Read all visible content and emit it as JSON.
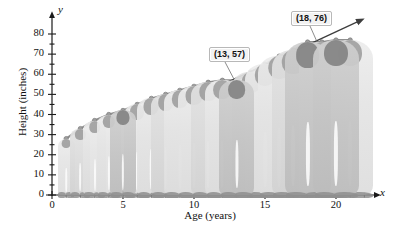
{
  "chart_data": {
    "type": "line",
    "title": "",
    "xlabel": "Age (years)",
    "ylabel": "Height (inches)",
    "x_axis_name": "x",
    "y_axis_name": "y",
    "xlim": [
      0,
      22
    ],
    "ylim": [
      0,
      85
    ],
    "grid": false,
    "legend": "none",
    "x_ticks_labeled": [
      "0",
      "5",
      "10",
      "15",
      "20"
    ],
    "x_ticks_labeled_values": [
      0,
      5,
      10,
      15,
      20
    ],
    "x_tick_step_minor": 1,
    "y_ticks_labeled": [
      "0",
      "10",
      "20",
      "30",
      "40",
      "50",
      "60",
      "70",
      "80"
    ],
    "y_ticks_labeled_values": [
      0,
      10,
      20,
      30,
      40,
      50,
      60,
      70,
      80
    ],
    "y_tick_step_minor": 5,
    "series": [
      {
        "name": "Height by age",
        "x": [
          1,
          2,
          3,
          4,
          5,
          6,
          7,
          8,
          9,
          10,
          11,
          12,
          13,
          14,
          15,
          16,
          17,
          18,
          19,
          20,
          21
        ],
        "values": [
          28,
          33,
          37,
          40,
          42,
          45,
          48,
          50,
          52,
          54,
          56,
          57,
          57,
          61,
          65,
          69,
          72,
          76,
          76,
          77,
          77
        ]
      }
    ],
    "annotations": [
      {
        "label": "(13, 57)",
        "x": 13,
        "y": 57
      },
      {
        "label": "(18, 76)",
        "x": 18,
        "y": 76
      }
    ],
    "secant_line": {
      "from": {
        "x": 9.0,
        "y": 45
      },
      "to": {
        "x": 21.5,
        "y": 86
      },
      "arrowheads": "both"
    }
  },
  "axis": {
    "y_axis_letter": "y",
    "x_axis_letter": "x",
    "y_title": "Height (inches)",
    "x_title": "Age (years)"
  },
  "callouts": {
    "point_a": "(13, 57)",
    "point_b": "(18, 76)"
  },
  "colors": {
    "axis": "#1a1a1a",
    "curve": "#8c8c8c",
    "secant": "#4a4a4a",
    "marker": "#a0a0a0",
    "callout_bg": "#f2f2f2",
    "callout_border": "#b8b8b8",
    "figure_light": "#e6e6e6",
    "figure_dark": "#c3c3c3"
  }
}
